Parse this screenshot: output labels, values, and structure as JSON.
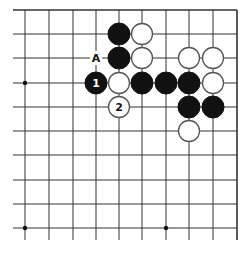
{
  "board": {
    "columns": 10,
    "rows": 10,
    "edges": [
      "top",
      "right"
    ],
    "line_color": "#333333",
    "star_points": [
      [
        0,
        3
      ],
      [
        0,
        9
      ],
      [
        6,
        9
      ]
    ]
  },
  "stones": [
    {
      "col": 4,
      "row": 1,
      "color": "black",
      "label": ""
    },
    {
      "col": 5,
      "row": 1,
      "color": "white",
      "label": ""
    },
    {
      "col": 4,
      "row": 2,
      "color": "black",
      "label": ""
    },
    {
      "col": 5,
      "row": 2,
      "color": "white",
      "label": ""
    },
    {
      "col": 7,
      "row": 2,
      "color": "white",
      "label": ""
    },
    {
      "col": 8,
      "row": 2,
      "color": "white",
      "label": ""
    },
    {
      "col": 3,
      "row": 3,
      "color": "black",
      "label": "1"
    },
    {
      "col": 4,
      "row": 3,
      "color": "white",
      "label": ""
    },
    {
      "col": 5,
      "row": 3,
      "color": "black",
      "label": ""
    },
    {
      "col": 6,
      "row": 3,
      "color": "black",
      "label": ""
    },
    {
      "col": 7,
      "row": 3,
      "color": "black",
      "label": ""
    },
    {
      "col": 8,
      "row": 3,
      "color": "white",
      "label": ""
    },
    {
      "col": 4,
      "row": 4,
      "color": "white",
      "label": "2"
    },
    {
      "col": 7,
      "row": 4,
      "color": "black",
      "label": ""
    },
    {
      "col": 8,
      "row": 4,
      "color": "black",
      "label": ""
    },
    {
      "col": 7,
      "row": 5,
      "color": "white",
      "label": ""
    }
  ],
  "markers": [
    {
      "col": 3,
      "row": 2,
      "label": "A"
    }
  ]
}
